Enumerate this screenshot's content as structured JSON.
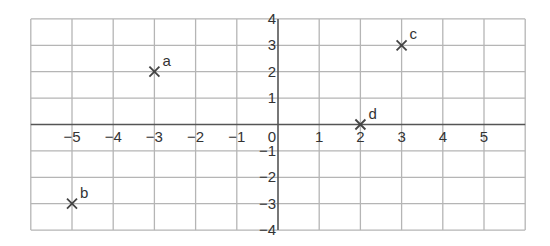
{
  "chart_data": {
    "type": "scatter",
    "title": "",
    "xlabel": "",
    "ylabel": "",
    "xlim": [
      -6,
      6
    ],
    "ylim": [
      -4,
      4
    ],
    "grid": true,
    "x_ticks": [
      -5,
      -4,
      -3,
      -2,
      -1,
      0,
      1,
      2,
      3,
      4,
      5
    ],
    "y_ticks": [
      4,
      3,
      2,
      1,
      -1,
      -2,
      -3,
      -4
    ],
    "points": [
      {
        "label": "a",
        "x": -3,
        "y": 2,
        "marker": "x"
      },
      {
        "label": "b",
        "x": -5,
        "y": -3,
        "marker": "x"
      },
      {
        "label": "c",
        "x": 3,
        "y": 3,
        "marker": "x"
      },
      {
        "label": "d",
        "x": 2,
        "y": 0,
        "marker": "x"
      }
    ]
  },
  "colors": {
    "grid": "#b5b5b5",
    "axis": "#555555",
    "text": "#333333",
    "marker": "#444444"
  }
}
